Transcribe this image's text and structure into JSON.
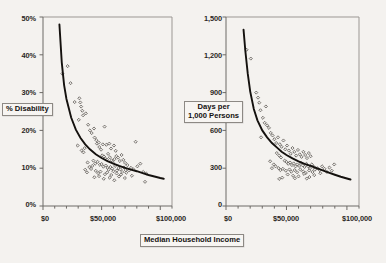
{
  "figure": {
    "background_color": "#f4f2ef",
    "ink_color": "#14110e",
    "panel_count": 2
  },
  "shared": {
    "xlabel": "Median Household Income",
    "x_ticklabels": [
      "$0",
      "$50,000",
      "$100,000"
    ]
  },
  "left_panel": {
    "ylabel": "% Disability",
    "y_ticklabels": [
      "0%",
      "10%",
      "20%",
      "30%",
      "40%",
      "50%"
    ]
  },
  "right_panel": {
    "ylabel_line1": "Days per",
    "ylabel_line2": "1,000 Persons",
    "y_ticklabels": [
      "0",
      "300",
      "600",
      "900",
      "1,200",
      "1,500"
    ]
  },
  "chart_data": [
    {
      "type": "scatter",
      "title": "",
      "xlabel": "Median Household Income",
      "ylabel": "% Disability",
      "xlim": [
        0,
        110000
      ],
      "ylim": [
        0,
        50
      ],
      "xticks": [
        0,
        50000,
        100000
      ],
      "xticklabels": [
        "$0",
        "$50,000",
        "$100,000"
      ],
      "x_minor_tick_interval": 10000,
      "yticks": [
        0,
        10,
        20,
        30,
        40,
        50
      ],
      "yticklabels": [
        "0%",
        "10%",
        "20%",
        "30%",
        "40%",
        "50%"
      ],
      "grid": false,
      "legend": false,
      "marker": "open-diamond",
      "fit_curve": {
        "type": "power",
        "description": "decaying power-law trend line",
        "x_start": 14000,
        "x_end": 103000,
        "y_start": 48,
        "y_end": 7.2,
        "points": [
          [
            14000,
            48.0
          ],
          [
            16000,
            38.0
          ],
          [
            18000,
            32.0
          ],
          [
            20000,
            28.3
          ],
          [
            24000,
            23.4
          ],
          [
            28000,
            20.2
          ],
          [
            32000,
            18.0
          ],
          [
            36000,
            16.3
          ],
          [
            40000,
            15.0
          ],
          [
            45000,
            13.7
          ],
          [
            50000,
            12.7
          ],
          [
            55000,
            11.9
          ],
          [
            60000,
            11.2
          ],
          [
            65000,
            10.6
          ],
          [
            70000,
            10.1
          ],
          [
            75000,
            9.6
          ],
          [
            80000,
            9.2
          ],
          [
            85000,
            8.7
          ],
          [
            90000,
            8.2
          ],
          [
            95000,
            7.8
          ],
          [
            100000,
            7.4
          ],
          [
            103000,
            7.2
          ]
        ]
      },
      "points": [
        [
          16500,
          35.0
        ],
        [
          21000,
          37.0
        ],
        [
          23500,
          32.5
        ],
        [
          27000,
          27.5
        ],
        [
          31000,
          28.5
        ],
        [
          31800,
          27.4
        ],
        [
          32500,
          26.3
        ],
        [
          33500,
          25.2
        ],
        [
          34200,
          24.0
        ],
        [
          36500,
          24.5
        ],
        [
          30500,
          22.8
        ],
        [
          38500,
          21.5
        ],
        [
          40000,
          20.0
        ],
        [
          41500,
          19.3
        ],
        [
          43500,
          20.5
        ],
        [
          52500,
          21.0
        ],
        [
          44000,
          18.1
        ],
        [
          45500,
          17.4
        ],
        [
          46000,
          16.5
        ],
        [
          47500,
          16.8
        ],
        [
          29500,
          16.0
        ],
        [
          33000,
          14.7
        ],
        [
          34500,
          14.2
        ],
        [
          35500,
          15.3
        ],
        [
          48000,
          15.6
        ],
        [
          49500,
          14.9
        ],
        [
          51000,
          16.3
        ],
        [
          54000,
          16.2
        ],
        [
          56500,
          16.5
        ],
        [
          58000,
          15.2
        ],
        [
          60500,
          16.0
        ],
        [
          62000,
          14.6
        ],
        [
          79000,
          17.0
        ],
        [
          50500,
          13.4
        ],
        [
          52000,
          13.1
        ],
        [
          53000,
          12.6
        ],
        [
          54500,
          12.3
        ],
        [
          55500,
          13.8
        ],
        [
          57000,
          12.9
        ],
        [
          58500,
          12.1
        ],
        [
          59500,
          11.6
        ],
        [
          61000,
          12.4
        ],
        [
          62500,
          13.2
        ],
        [
          64000,
          12.8
        ],
        [
          65500,
          11.9
        ],
        [
          67000,
          13.5
        ],
        [
          68500,
          12.2
        ],
        [
          70000,
          11.4
        ],
        [
          43000,
          12.0
        ],
        [
          44500,
          11.2
        ],
        [
          46500,
          11.7
        ],
        [
          48500,
          10.9
        ],
        [
          50000,
          11.1
        ],
        [
          51500,
          10.4
        ],
        [
          53500,
          10.7
        ],
        [
          55000,
          10.1
        ],
        [
          56000,
          9.6
        ],
        [
          57500,
          10.3
        ],
        [
          59000,
          9.9
        ],
        [
          60000,
          9.2
        ],
        [
          61500,
          10.6
        ],
        [
          63000,
          9.4
        ],
        [
          64500,
          10.0
        ],
        [
          66000,
          9.7
        ],
        [
          67500,
          9.0
        ],
        [
          69000,
          10.2
        ],
        [
          70500,
          9.5
        ],
        [
          72000,
          10.8
        ],
        [
          38000,
          11.5
        ],
        [
          39500,
          10.3
        ],
        [
          41000,
          9.8
        ],
        [
          42000,
          10.6
        ],
        [
          45000,
          9.3
        ],
        [
          47000,
          8.7
        ],
        [
          49000,
          9.1
        ],
        [
          52800,
          8.4
        ],
        [
          54800,
          8.9
        ],
        [
          58200,
          8.2
        ],
        [
          62800,
          8.6
        ],
        [
          66500,
          8.3
        ],
        [
          71000,
          8.8
        ],
        [
          73500,
          9.4
        ],
        [
          75000,
          10.1
        ],
        [
          77000,
          9.7
        ],
        [
          80500,
          10.5
        ],
        [
          83000,
          11.2
        ],
        [
          85500,
          9.0
        ],
        [
          88000,
          8.6
        ],
        [
          43800,
          7.6
        ],
        [
          47800,
          7.9
        ],
        [
          51800,
          7.2
        ],
        [
          56800,
          7.5
        ],
        [
          60800,
          6.8
        ],
        [
          64800,
          7.8
        ],
        [
          69800,
          7.4
        ],
        [
          75800,
          8.0
        ],
        [
          87000,
          6.4
        ],
        [
          36000,
          9.6
        ],
        [
          37500,
          8.9
        ]
      ]
    },
    {
      "type": "scatter",
      "title": "",
      "xlabel": "Median Household Income",
      "ylabel": "Days per 1,000 Persons",
      "xlim": [
        0,
        110000
      ],
      "ylim": [
        0,
        1500
      ],
      "xticks": [
        0,
        50000,
        100000
      ],
      "xticklabels": [
        "$0",
        "$50,000",
        "$100,000"
      ],
      "x_minor_tick_interval": 10000,
      "yticks": [
        0,
        300,
        600,
        900,
        1200,
        1500
      ],
      "yticklabels": [
        "0",
        "300",
        "600",
        "900",
        "1,200",
        "1,500"
      ],
      "grid": false,
      "legend": false,
      "marker": "open-diamond",
      "fit_curve": {
        "type": "power",
        "description": "decaying power-law trend line",
        "x_start": 14500,
        "x_end": 103000,
        "y_start": 1400,
        "y_end": 210,
        "points": [
          [
            14500,
            1400
          ],
          [
            16000,
            1230
          ],
          [
            18000,
            1050
          ],
          [
            20000,
            910
          ],
          [
            23000,
            770
          ],
          [
            26000,
            680
          ],
          [
            30000,
            600
          ],
          [
            34000,
            545
          ],
          [
            38000,
            500
          ],
          [
            42000,
            465
          ],
          [
            46000,
            430
          ],
          [
            50000,
            405
          ],
          [
            55000,
            378
          ],
          [
            60000,
            355
          ],
          [
            65000,
            335
          ],
          [
            70000,
            318
          ],
          [
            75000,
            300
          ],
          [
            80000,
            283
          ],
          [
            85000,
            265
          ],
          [
            90000,
            248
          ],
          [
            95000,
            232
          ],
          [
            100000,
            218
          ],
          [
            103000,
            210
          ]
        ]
      },
      "points": [
        [
          17000,
          1240
        ],
        [
          20500,
          1170
        ],
        [
          25000,
          900
        ],
        [
          26500,
          860
        ],
        [
          27500,
          820
        ],
        [
          28500,
          760
        ],
        [
          33000,
          790
        ],
        [
          30500,
          700
        ],
        [
          32000,
          660
        ],
        [
          34000,
          640
        ],
        [
          35500,
          620
        ],
        [
          37000,
          580
        ],
        [
          29000,
          545
        ],
        [
          38500,
          560
        ],
        [
          40000,
          530
        ],
        [
          41500,
          500
        ],
        [
          43000,
          545
        ],
        [
          44500,
          490
        ],
        [
          46000,
          470
        ],
        [
          47500,
          520
        ],
        [
          42000,
          420
        ],
        [
          44000,
          400
        ],
        [
          45500,
          385
        ],
        [
          49000,
          450
        ],
        [
          50500,
          480
        ],
        [
          52000,
          440
        ],
        [
          53500,
          415
        ],
        [
          55000,
          460
        ],
        [
          56500,
          430
        ],
        [
          58000,
          400
        ],
        [
          59500,
          445
        ],
        [
          61000,
          410
        ],
        [
          62500,
          390
        ],
        [
          64000,
          430
        ],
        [
          65500,
          405
        ],
        [
          67000,
          380
        ],
        [
          68500,
          420
        ],
        [
          70000,
          395
        ],
        [
          48500,
          360
        ],
        [
          50000,
          350
        ],
        [
          51500,
          335
        ],
        [
          53000,
          345
        ],
        [
          54500,
          325
        ],
        [
          56000,
          338
        ],
        [
          57500,
          315
        ],
        [
          59000,
          330
        ],
        [
          60500,
          318
        ],
        [
          62000,
          342
        ],
        [
          63500,
          322
        ],
        [
          65000,
          310
        ],
        [
          66500,
          335
        ],
        [
          68000,
          315
        ],
        [
          69500,
          300
        ],
        [
          71000,
          330
        ],
        [
          72500,
          312
        ],
        [
          74000,
          295
        ],
        [
          39500,
          330
        ],
        [
          41000,
          315
        ],
        [
          36500,
          355
        ],
        [
          38000,
          300
        ],
        [
          43500,
          300
        ],
        [
          45000,
          285
        ],
        [
          47000,
          295
        ],
        [
          49500,
          280
        ],
        [
          52500,
          290
        ],
        [
          54000,
          272
        ],
        [
          56800,
          285
        ],
        [
          58800,
          268
        ],
        [
          61500,
          290
        ],
        [
          63800,
          275
        ],
        [
          66000,
          262
        ],
        [
          68800,
          282
        ],
        [
          71500,
          270
        ],
        [
          73500,
          288
        ],
        [
          75500,
          300
        ],
        [
          77500,
          285
        ],
        [
          79500,
          315
        ],
        [
          81500,
          295
        ],
        [
          83500,
          270
        ],
        [
          85500,
          305
        ],
        [
          87500,
          280
        ],
        [
          89500,
          330
        ],
        [
          46500,
          225
        ],
        [
          51000,
          250
        ],
        [
          55500,
          240
        ],
        [
          60000,
          235
        ],
        [
          64500,
          255
        ],
        [
          69000,
          230
        ],
        [
          73000,
          245
        ],
        [
          78000,
          260
        ],
        [
          44000,
          215
        ],
        [
          57000,
          220
        ],
        [
          66800,
          218
        ]
      ]
    }
  ]
}
